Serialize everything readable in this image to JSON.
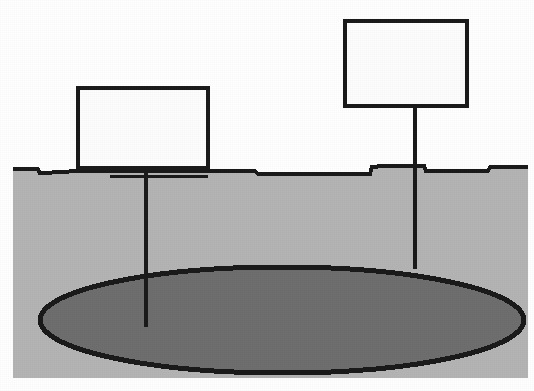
{
  "figure": {
    "type": "geological-cross-section",
    "canvas": {
      "width": 534,
      "height": 391,
      "background": "#ffffff"
    },
    "colors": {
      "line": "#1a1a1a",
      "soil_fill": "#b4b4b4",
      "lens_fill": "#6e6e6e",
      "box_fill": "#fdfdfd",
      "page_background": "#ffffff"
    }
  },
  "ground": {
    "name": "ground-surface",
    "label": "",
    "surface_y": 172,
    "left_x": 13,
    "right_x": 528,
    "bottom_y": 378,
    "fill": "#b4b4b4",
    "outline_width": 4
  },
  "lens": {
    "name": "subsurface-lens",
    "label": "",
    "center_x": 282,
    "center_y": 320,
    "radius_x": 242,
    "radius_y": 53,
    "fill": "#6e6e6e",
    "outline_width": 5
  },
  "wells": [
    {
      "id": "left-well",
      "label": "",
      "stem_x": 146,
      "stem_top_y": 166,
      "stem_bottom_y": 327,
      "stem_width": 4,
      "callout_box": {
        "x": 78,
        "y": 88,
        "width": 130,
        "height": 80,
        "text": ""
      },
      "collar_line": {
        "x1": 110,
        "x2": 208,
        "y": 176,
        "width": 3
      }
    },
    {
      "id": "right-well",
      "label": "",
      "stem_x": 415,
      "stem_top_y": 104,
      "stem_bottom_y": 269,
      "stem_width": 4,
      "callout_box": {
        "x": 345,
        "y": 21,
        "width": 122,
        "height": 85,
        "text": ""
      },
      "collar_line": {
        "x1": 415,
        "x2": 415,
        "y": 172,
        "width": 0
      }
    }
  ],
  "annotations": []
}
